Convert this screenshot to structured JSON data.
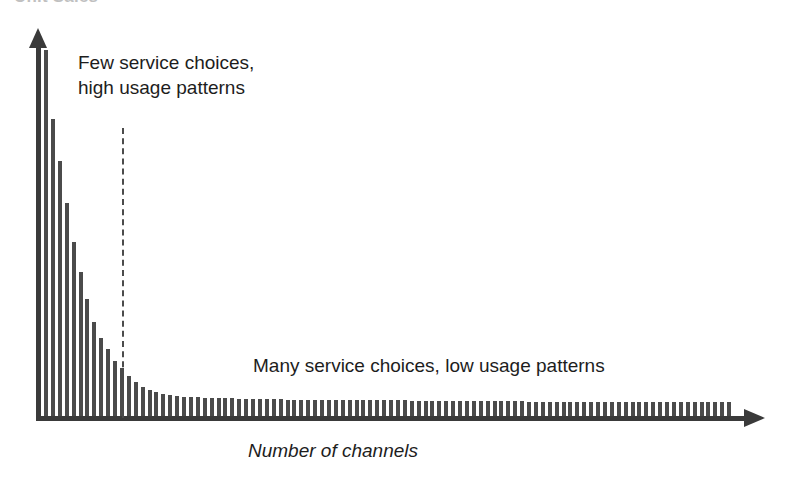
{
  "figure": {
    "cut_off_title": "Unit Sales",
    "background_color": "#ffffff",
    "ink_color": "#3a3a3a",
    "bar_color": "#4b4b4b"
  },
  "annotations": {
    "few": "Few service choices,\nhigh usage patterns",
    "many": "Many service choices, low usage patterns",
    "divider_label": ""
  },
  "axes": {
    "x_label": "Number of channels",
    "y_label": "",
    "x_arrow": "arrow-right",
    "y_arrow": "arrow-up"
  },
  "chart_data": {
    "type": "bar",
    "title": "Unit Sales",
    "xlabel": "Number of channels",
    "ylabel": "",
    "grid": false,
    "legend": false,
    "ylim": [
      0,
      100
    ],
    "xlim": [
      0,
      100
    ],
    "annotations": [
      {
        "text": "Few service choices, high usage patterns",
        "region": "head-left",
        "x": 6,
        "y": 92
      },
      {
        "text": "Many service choices, low usage patterns",
        "region": "tail-right",
        "x": 42,
        "y": 17
      }
    ],
    "divider": {
      "type": "vertical-dashed",
      "x_index": 12,
      "style": "dashed",
      "note": "separates head from long tail"
    },
    "categories": [
      1,
      2,
      3,
      4,
      5,
      6,
      7,
      8,
      9,
      10,
      11,
      12,
      13,
      14,
      15,
      16,
      17,
      18,
      19,
      20,
      21,
      22,
      23,
      24,
      25,
      26,
      27,
      28,
      29,
      30,
      31,
      32,
      33,
      34,
      35,
      36,
      37,
      38,
      39,
      40,
      41,
      42,
      43,
      44,
      45,
      46,
      47,
      48,
      49,
      50,
      51,
      52,
      53,
      54,
      55,
      56,
      57,
      58,
      59,
      60,
      61,
      62,
      63,
      64,
      65,
      66,
      67,
      68,
      69,
      70,
      71,
      72,
      73,
      74,
      75,
      76,
      77,
      78,
      79,
      80,
      81,
      82,
      83,
      84,
      85,
      86,
      87,
      88,
      89,
      90,
      91,
      92,
      93,
      94,
      95,
      96,
      97,
      98,
      99,
      100
    ],
    "values": [
      96,
      78,
      67,
      56,
      46,
      38,
      31,
      25,
      21,
      18,
      15,
      13,
      11,
      9.5,
      8.2,
      7.4,
      6.8,
      6.3,
      6.0,
      5.8,
      5.6,
      5.5,
      5.4,
      5.3,
      5.2,
      5.2,
      5.1,
      5.1,
      5.0,
      5.0,
      5.0,
      4.9,
      4.9,
      4.9,
      4.9,
      4.8,
      4.8,
      4.8,
      4.8,
      4.8,
      4.7,
      4.7,
      4.7,
      4.7,
      4.7,
      4.7,
      4.6,
      4.6,
      4.6,
      4.6,
      4.6,
      4.6,
      4.6,
      4.5,
      4.5,
      4.5,
      4.5,
      4.5,
      4.5,
      4.5,
      4.5,
      4.4,
      4.4,
      4.4,
      4.4,
      4.4,
      4.4,
      4.4,
      4.4,
      4.4,
      4.3,
      4.3,
      4.3,
      4.3,
      4.3,
      4.3,
      4.3,
      4.3,
      4.3,
      4.3,
      4.2,
      4.2,
      4.2,
      4.2,
      4.2,
      4.2,
      4.2,
      4.2,
      4.2,
      4.2,
      4.2,
      4.1,
      4.1,
      4.1,
      4.1,
      4.1,
      4.1,
      4.1,
      4.1,
      4.1
    ],
    "shape": "long-tail / power-law decay"
  },
  "layout": {
    "baseline_y": 418,
    "axis_x_left": 39,
    "bar_pitch": 6.9,
    "bar_width": 4,
    "first_bar_x": 44,
    "max_bar_height": 368,
    "divider_x": 122
  }
}
